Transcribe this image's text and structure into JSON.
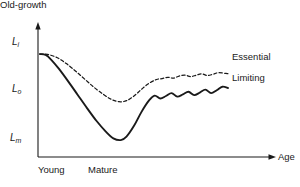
{
  "chart_data": {
    "type": "line",
    "title": "",
    "xlabel": "Age",
    "ylabel": "",
    "grid": false,
    "legend_position": "right-inline",
    "x_categories": [
      "Young",
      "Mature",
      "Old-growth"
    ],
    "y_tick_labels": [
      "L_i",
      "L_o",
      "L_m"
    ],
    "y_tick_descriptions": [
      "L_i : initial / pre-disturbance level",
      "L_o : intermediate reference level",
      "L_m : minimum level"
    ],
    "ylim": [
      0,
      1
    ],
    "xlim": [
      0,
      1
    ],
    "series": [
      {
        "name": "Essential",
        "style": "dashed",
        "color": "#1a1a1a",
        "x": [
          0.0,
          0.04,
          0.09,
          0.14,
          0.19,
          0.24,
          0.29,
          0.34,
          0.38,
          0.42,
          0.46,
          0.5,
          0.54,
          0.58,
          0.62,
          0.65,
          0.68,
          0.71,
          0.74,
          0.77,
          0.8,
          0.83,
          0.86,
          0.89,
          0.92,
          0.95,
          1.0
        ],
        "y": [
          0.855,
          0.852,
          0.828,
          0.78,
          0.72,
          0.655,
          0.59,
          0.535,
          0.498,
          0.48,
          0.488,
          0.525,
          0.578,
          0.625,
          0.655,
          0.662,
          0.672,
          0.665,
          0.682,
          0.69,
          0.678,
          0.688,
          0.7,
          0.686,
          0.696,
          0.708,
          0.7
        ]
      },
      {
        "name": "Limiting",
        "style": "solid",
        "color": "#1a1a1a",
        "x": [
          0.0,
          0.03,
          0.06,
          0.1,
          0.15,
          0.2,
          0.25,
          0.3,
          0.35,
          0.39,
          0.43,
          0.46,
          0.5,
          0.54,
          0.58,
          0.61,
          0.64,
          0.67,
          0.7,
          0.73,
          0.76,
          0.79,
          0.82,
          0.85,
          0.88,
          0.91,
          0.94,
          0.97,
          1.0
        ],
        "y": [
          0.855,
          0.848,
          0.81,
          0.74,
          0.64,
          0.535,
          0.43,
          0.33,
          0.245,
          0.192,
          0.178,
          0.205,
          0.29,
          0.4,
          0.49,
          0.528,
          0.505,
          0.525,
          0.548,
          0.52,
          0.538,
          0.558,
          0.532,
          0.552,
          0.575,
          0.548,
          0.57,
          0.598,
          0.588
        ]
      }
    ],
    "annotations": [
      {
        "name": "essential-label",
        "text": "Essential"
      },
      {
        "name": "limiting-label",
        "text": "Limiting"
      }
    ]
  },
  "axes": {
    "x_axis_label": "Age",
    "y_ticks": [
      {
        "base": "L",
        "sub": "i"
      },
      {
        "base": "L",
        "sub": "o"
      },
      {
        "base": "L",
        "sub": "m"
      }
    ],
    "x_stages": [
      {
        "label": "Young"
      },
      {
        "label": "Mature"
      },
      {
        "label": "Old-growth"
      }
    ]
  },
  "legend": {
    "essential": "Essential",
    "limiting": "Limiting"
  },
  "colors": {
    "ink": "#1a1a1a",
    "background": "#ffffff"
  }
}
